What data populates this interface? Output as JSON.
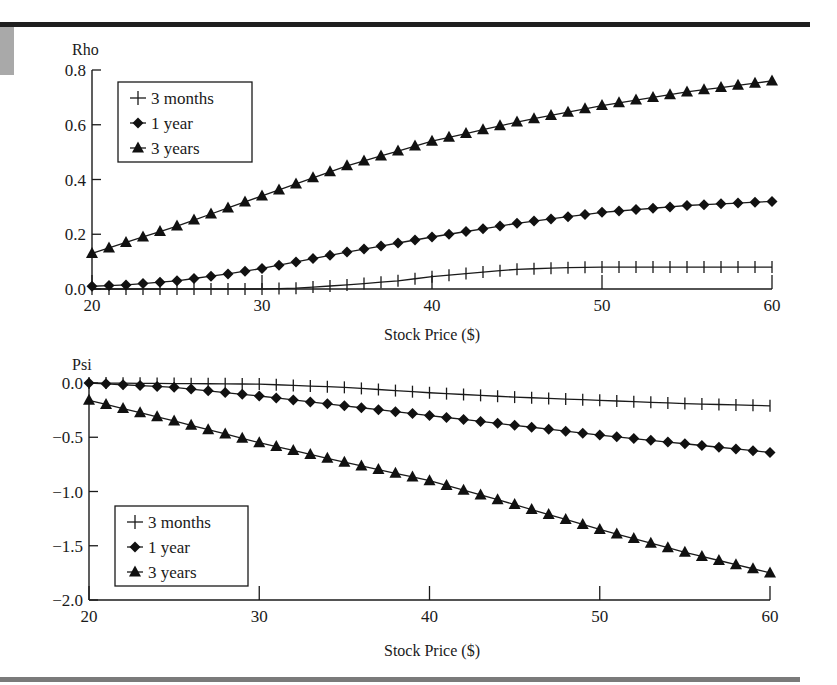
{
  "chart_data": [
    {
      "type": "line",
      "title": "",
      "ylabel": "Rho",
      "xlabel": "Stock Price ($)",
      "xlim": [
        20,
        60
      ],
      "ylim": [
        0.0,
        0.8
      ],
      "xticks": [
        20,
        30,
        40,
        50,
        60
      ],
      "yticks": [
        "0.0",
        "0.2",
        "0.4",
        "0.6",
        "0.8"
      ],
      "ytick_values": [
        0.0,
        0.2,
        0.4,
        0.6,
        0.8
      ],
      "grid": false,
      "legend_position": "upper left",
      "x_step": 1,
      "series": [
        {
          "name": "3 months",
          "marker": "plus",
          "anchors_x": [
            20,
            30,
            32,
            35,
            38,
            40,
            43,
            45,
            48,
            50,
            55,
            60
          ],
          "anchors_y": [
            0.0,
            0.0,
            0.003,
            0.015,
            0.03,
            0.045,
            0.062,
            0.072,
            0.078,
            0.08,
            0.08,
            0.08
          ]
        },
        {
          "name": "1 year",
          "marker": "diamond",
          "anchors_x": [
            20,
            22,
            25,
            28,
            30,
            35,
            40,
            45,
            50,
            55,
            60
          ],
          "anchors_y": [
            0.01,
            0.015,
            0.03,
            0.055,
            0.075,
            0.135,
            0.19,
            0.24,
            0.28,
            0.305,
            0.32
          ]
        },
        {
          "name": "3 years",
          "marker": "triangle",
          "anchors_x": [
            20,
            25,
            30,
            35,
            40,
            45,
            50,
            55,
            60
          ],
          "anchors_y": [
            0.13,
            0.23,
            0.34,
            0.45,
            0.54,
            0.61,
            0.67,
            0.72,
            0.76
          ]
        }
      ]
    },
    {
      "type": "line",
      "title": "",
      "ylabel": "Psi",
      "xlabel": "Stock Price ($)",
      "xlim": [
        20,
        60
      ],
      "ylim": [
        -2.0,
        0.0
      ],
      "xticks": [
        20,
        30,
        40,
        50,
        60
      ],
      "yticks": [
        "0.0",
        "−0.5",
        "−1.0",
        "−1.5",
        "−2.0"
      ],
      "ytick_values": [
        0.0,
        -0.5,
        -1.0,
        -1.5,
        -2.0
      ],
      "grid": false,
      "legend_position": "lower left",
      "x_step": 1,
      "series": [
        {
          "name": "3 months",
          "marker": "plus",
          "anchors_x": [
            20,
            30,
            35,
            40,
            45,
            50,
            55,
            60
          ],
          "anchors_y": [
            0.0,
            -0.01,
            -0.04,
            -0.09,
            -0.13,
            -0.16,
            -0.19,
            -0.21
          ]
        },
        {
          "name": "1 year",
          "marker": "diamond",
          "anchors_x": [
            20,
            25,
            30,
            35,
            40,
            45,
            50,
            55,
            60
          ],
          "anchors_y": [
            0.0,
            -0.04,
            -0.12,
            -0.21,
            -0.3,
            -0.39,
            -0.48,
            -0.56,
            -0.64
          ]
        },
        {
          "name": "3 years",
          "marker": "triangle",
          "anchors_x": [
            20,
            25,
            30,
            35,
            40,
            45,
            50,
            55,
            60
          ],
          "anchors_y": [
            -0.16,
            -0.35,
            -0.55,
            -0.73,
            -0.9,
            -1.12,
            -1.35,
            -1.56,
            -1.75
          ]
        }
      ]
    }
  ],
  "layout": {
    "panels": [
      {
        "plot_left": 92,
        "plot_right": 772,
        "plot_top": 70,
        "plot_bottom": 289,
        "legend": {
          "x": 118,
          "y": 82,
          "w": 134,
          "h": 80
        },
        "ylabel_pos": [
          72,
          55
        ],
        "xlabel_pos": [
          432,
          340
        ]
      },
      {
        "plot_left": 89,
        "plot_right": 770,
        "plot_top": 383,
        "plot_bottom": 600,
        "legend": {
          "x": 115,
          "y": 506,
          "w": 133,
          "h": 80
        },
        "ylabel_pos": [
          72,
          370
        ],
        "xlabel_pos": [
          432,
          656
        ]
      }
    ]
  }
}
